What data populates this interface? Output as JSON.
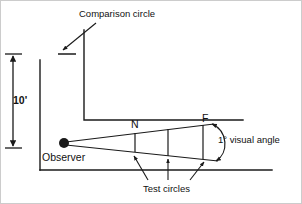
{
  "figure": {
    "title_alt": "Visual angle test circle diagram",
    "labels": {
      "comparison_circle": "Comparison circle",
      "dimension": "10'",
      "observer": "Observer",
      "near_marker": "N",
      "far_marker": "F",
      "visual_angle": "1° visual angle",
      "test_circles": "Test circles"
    },
    "colors": {
      "stroke": "#1a1a1a",
      "frame": "#cccccc",
      "background": "#ffffff"
    },
    "geometry": {
      "observer_point": {
        "x": 64,
        "y": 143,
        "r": 5
      },
      "wall_vertical": {
        "x": 84,
        "y_top": 30,
        "y_bottom": 120
      },
      "wall_horizontal": {
        "y": 120,
        "x_start": 84,
        "x_end": 243
      },
      "floor_line": {
        "y": 170,
        "x_start": 40,
        "x_end": 272
      },
      "dimension_line": {
        "x": 13,
        "y_top": 54,
        "y_bottom": 148
      },
      "comparison_mark": {
        "x_start": 58,
        "x_end": 76,
        "y": 54
      },
      "cone_upper_end": {
        "x": 212,
        "y": 124
      },
      "cone_lower_end": {
        "x": 216,
        "y": 160
      },
      "test_circle_x": [
        135,
        168,
        203
      ],
      "arc": {
        "cx": 216,
        "cy": 142,
        "rx": 13,
        "ry": 19
      }
    }
  }
}
